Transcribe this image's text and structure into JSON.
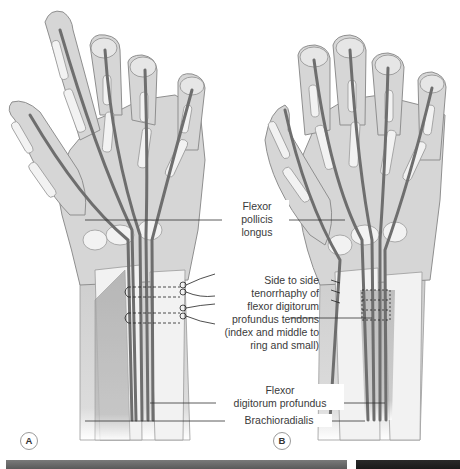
{
  "figure": {
    "panels": [
      {
        "id": "A",
        "tag": "A"
      },
      {
        "id": "B",
        "tag": "B"
      }
    ],
    "labels": {
      "flexor_pollicis_longus": [
        "Flexor",
        "pollicis",
        "longus"
      ],
      "tenorrhaphy": [
        "Side to side",
        "tenorrhaphy of",
        "flexor digitorum",
        "profundus tendons",
        "(index and middle to",
        "ring and small)"
      ],
      "flexor_digitorum_profundus": [
        "Flexor",
        "digitorum profundus"
      ],
      "brachioradialis": "Brachioradialis"
    },
    "colors": {
      "skin": "#d9d9d9",
      "skin_outline": "#8f8f8f",
      "bone": "#f2f2f2",
      "bone_outline": "#9a9a9a",
      "tendon": "#7d7d7d",
      "tendon_dark": "#555555",
      "leader_line": "#333333",
      "suture": "#222222"
    }
  }
}
